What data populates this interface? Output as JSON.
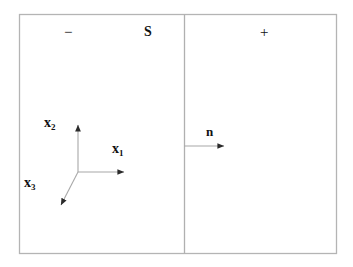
{
  "figure": {
    "background_color": "#ffffff",
    "line_color": "#8c8c8c",
    "axis_color": "#9a9a9a",
    "text_color": "#111111",
    "width": 353,
    "height": 267
  },
  "boundary_box": {
    "name": "outer-rectangle",
    "x": 19,
    "y": 14,
    "width": 318,
    "height": 240
  },
  "surface": {
    "label": "S",
    "description": "vertical dividing surface line",
    "x": 184,
    "y_top": 14,
    "y_bottom": 254
  },
  "regions": {
    "negative_side_label": "−",
    "positive_side_label": "+"
  },
  "normal_vector": {
    "label": "n",
    "x_start": 184,
    "x_end": 228,
    "y": 146
  },
  "axes": {
    "origin": {
      "x": 78,
      "y": 172
    },
    "items": [
      {
        "name": "x1",
        "label": "x",
        "subscript": "1",
        "direction": "right",
        "tip_x": 128,
        "tip_y": 172
      },
      {
        "name": "x2",
        "label": "x",
        "subscript": "2",
        "direction": "up",
        "tip_x": 78,
        "tip_y": 121
      },
      {
        "name": "x3",
        "label": "x",
        "subscript": "3",
        "direction": "down-left",
        "tip_x": 58,
        "tip_y": 209
      }
    ]
  }
}
